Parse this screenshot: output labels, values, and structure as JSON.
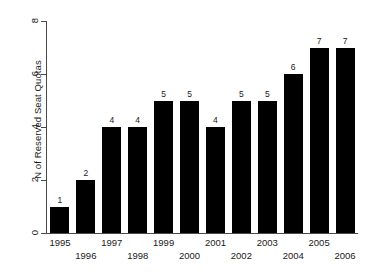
{
  "chart_data": {
    "type": "bar",
    "title": "",
    "xlabel": "",
    "ylabel": "N of Reserved Seat Quotas",
    "categories": [
      "1995",
      "1996",
      "1997",
      "1998",
      "1999",
      "2000",
      "2001",
      "2002",
      "2003",
      "2004",
      "2005",
      "2006"
    ],
    "values": [
      1,
      2,
      4,
      4,
      5,
      5,
      4,
      5,
      5,
      6,
      7,
      7
    ],
    "value_labels": [
      "1",
      "2",
      "4",
      "4",
      "5",
      "5",
      "4",
      "5",
      "5",
      "6",
      "7",
      "7"
    ],
    "ylim": [
      0,
      8
    ],
    "yticks": [
      0,
      2,
      4,
      6,
      8
    ],
    "ytick_labels": [
      "0",
      "2",
      "4",
      "6",
      "8"
    ],
    "grid": false,
    "legend": false,
    "bar_color": "#000000",
    "background_color": "#ffffff",
    "axis_color": "#4a4a4a",
    "text_color": "#1a1a1a",
    "xtick_label_rows": [
      0,
      1,
      0,
      1,
      0,
      1,
      0,
      1,
      0,
      1,
      0,
      1
    ]
  }
}
